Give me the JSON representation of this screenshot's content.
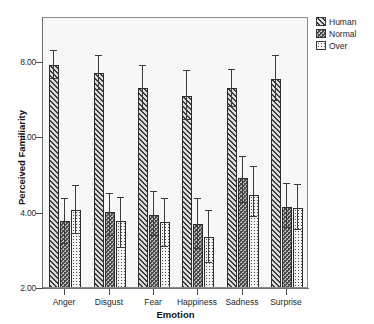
{
  "chart_data": {
    "type": "bar",
    "title": "",
    "xlabel": "Emotion",
    "ylabel": "Perceived Familiarity",
    "categories": [
      "Anger",
      "Disgust",
      "Fear",
      "Happiness",
      "Sadness",
      "Surprise"
    ],
    "ylim": [
      2.0,
      9.2
    ],
    "yticks": [
      2.0,
      4.0,
      6.0,
      8.0
    ],
    "ytick_labels": [
      "2.00",
      "4.00",
      "6.00",
      "8.00"
    ],
    "grid": false,
    "legend_position": "top-right",
    "error_bars": "95% CI",
    "series": [
      {
        "name": "Human",
        "pattern": "diagonal-hatch",
        "color": "#cfcfcf",
        "values": [
          7.95,
          7.75,
          7.33,
          7.12,
          7.33,
          7.57
        ],
        "err_low": [
          7.58,
          7.3,
          6.76,
          6.48,
          6.83,
          7.0
        ],
        "err_high": [
          8.32,
          8.18,
          7.92,
          7.78,
          7.82,
          8.18
        ]
      },
      {
        "name": "Normal",
        "pattern": "cross-hatch",
        "color": "#bdbdbd",
        "values": [
          3.8,
          4.05,
          3.97,
          3.72,
          4.95,
          4.18
        ],
        "err_low": [
          3.2,
          3.42,
          3.4,
          3.05,
          4.28,
          3.62
        ],
        "err_high": [
          4.4,
          4.52,
          4.57,
          4.4,
          5.5,
          4.78
        ]
      },
      {
        "name": "Over",
        "pattern": "dotted",
        "color": "#f4f4f4",
        "values": [
          4.1,
          3.8,
          3.78,
          3.37,
          4.5,
          4.15
        ],
        "err_low": [
          3.47,
          3.08,
          3.12,
          2.68,
          3.9,
          3.57
        ],
        "err_high": [
          4.73,
          4.42,
          4.4,
          4.08,
          5.23,
          4.77
        ]
      }
    ]
  },
  "legend": {
    "items": [
      {
        "label": "Human"
      },
      {
        "label": "Normal"
      },
      {
        "label": "Over"
      }
    ]
  },
  "axes": {
    "y_title": "Perceived Familiarity",
    "x_title": "Emotion"
  }
}
